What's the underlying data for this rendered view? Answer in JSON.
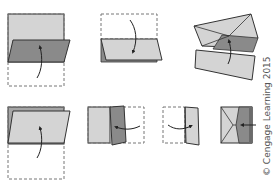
{
  "figure": {
    "colors": {
      "light_fill": "#d4d4d4",
      "mid_fill": "#a6a6a6",
      "dark_fill": "#8a8a8a",
      "outline": "#333333",
      "dashed": "#777777",
      "arrow": "#222222"
    },
    "steps": [
      {
        "id": 1,
        "label": "fold bottom half up"
      },
      {
        "id": 2,
        "label": "fold top flap down"
      },
      {
        "id": 3,
        "label": "fold corners to center"
      },
      {
        "id": 4,
        "label": "fold bottom up"
      },
      {
        "id": 5,
        "label": "fold right side over"
      },
      {
        "id": 6,
        "label": "fold left side over"
      },
      {
        "id": 7,
        "label": "finished pocket"
      }
    ]
  },
  "copyright": "© Cengage Learning 2015"
}
